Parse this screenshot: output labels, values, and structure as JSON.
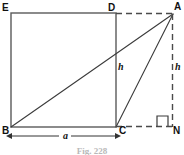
{
  "figure": {
    "caption": "Fig. 228",
    "colors": {
      "stroke": "#3b3b3b",
      "dashed": "#4a4a4a",
      "dimension": "#333333",
      "text": "#111111",
      "caption": "#b9b9b9",
      "background": "#ffffff"
    },
    "vertex_labels": [
      {
        "name": "E",
        "text": "E",
        "x": 2,
        "y": 3
      },
      {
        "name": "D",
        "text": "D",
        "x": 108,
        "y": 3
      },
      {
        "name": "A",
        "text": "A",
        "x": 174,
        "y": 2
      },
      {
        "name": "B",
        "text": "B",
        "x": 2,
        "y": 126
      },
      {
        "name": "C",
        "text": "C",
        "x": 119,
        "y": 126
      },
      {
        "name": "N",
        "text": "N",
        "x": 173,
        "y": 126
      }
    ],
    "length_labels": [
      {
        "name": "height-inner",
        "text": "h",
        "x": 118,
        "y": 62
      },
      {
        "name": "height-outer",
        "text": "h",
        "x": 175,
        "y": 62
      },
      {
        "name": "base-side",
        "text": "a",
        "x": 63,
        "y": 131
      }
    ],
    "geometry": {
      "square": {
        "x": 11,
        "y": 13,
        "width": 105,
        "height": 114
      },
      "points": {
        "E": [
          11,
          13
        ],
        "D": [
          116,
          13
        ],
        "A": [
          173,
          14
        ],
        "B": [
          11,
          127
        ],
        "C": [
          116,
          127
        ],
        "N": [
          173,
          127
        ]
      },
      "solid_segments": [
        {
          "name": "square-edge-top",
          "from": "E",
          "to": "D"
        },
        {
          "name": "square-edge-left",
          "from": "E",
          "to": "B"
        },
        {
          "name": "square-edge-right",
          "from": "D",
          "to": "C"
        },
        {
          "name": "square-edge-bottom",
          "from": "B",
          "to": "C"
        },
        {
          "name": "diagonal-b-to-a",
          "from": "B",
          "to": "A"
        },
        {
          "name": "segment-c-to-a",
          "from": "C",
          "to": "A"
        }
      ],
      "dashed_segments": [
        {
          "name": "dashed-d-to-a",
          "from": "D",
          "to": "A"
        },
        {
          "name": "dashed-a-to-n",
          "from": "A",
          "to": "N"
        },
        {
          "name": "dashed-c-to-n",
          "from": "C",
          "to": "N"
        }
      ],
      "right_angle_marker": {
        "name": "right-angle-at-n",
        "x": 157,
        "y": 115,
        "size": 11
      },
      "dimension_line": {
        "name": "dimension-a",
        "x1": 11,
        "x2": 116,
        "y": 136
      }
    }
  }
}
